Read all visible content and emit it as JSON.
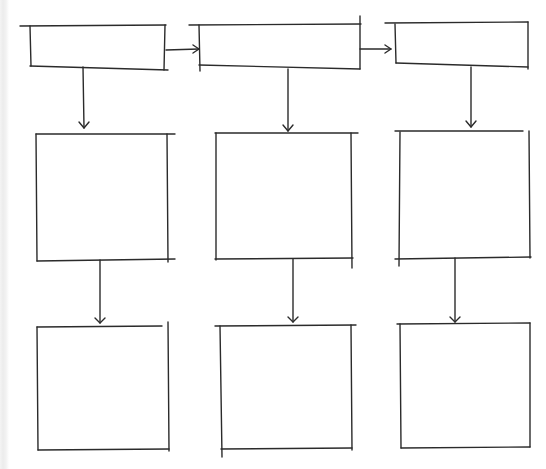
{
  "diagram": {
    "title": "",
    "line_color": "#2b2b2b",
    "background_color": "#ffffff",
    "nodes": [
      {
        "id": "top-1",
        "row": 0,
        "col": 0,
        "label": "",
        "shape": "wide-rectangle"
      },
      {
        "id": "top-2",
        "row": 0,
        "col": 1,
        "label": "",
        "shape": "wide-rectangle"
      },
      {
        "id": "top-3",
        "row": 0,
        "col": 2,
        "label": "",
        "shape": "wide-rectangle"
      },
      {
        "id": "mid-1",
        "row": 1,
        "col": 0,
        "label": "",
        "shape": "square"
      },
      {
        "id": "mid-2",
        "row": 1,
        "col": 1,
        "label": "",
        "shape": "square"
      },
      {
        "id": "mid-3",
        "row": 1,
        "col": 2,
        "label": "",
        "shape": "square"
      },
      {
        "id": "bot-1",
        "row": 2,
        "col": 0,
        "label": "",
        "shape": "square"
      },
      {
        "id": "bot-2",
        "row": 2,
        "col": 1,
        "label": "",
        "shape": "square"
      },
      {
        "id": "bot-3",
        "row": 2,
        "col": 2,
        "label": "",
        "shape": "square"
      }
    ],
    "edges": [
      {
        "from": "top-1",
        "to": "top-2",
        "direction": "right"
      },
      {
        "from": "top-2",
        "to": "top-3",
        "direction": "right"
      },
      {
        "from": "top-1",
        "to": "mid-1",
        "direction": "down"
      },
      {
        "from": "top-2",
        "to": "mid-2",
        "direction": "down"
      },
      {
        "from": "top-3",
        "to": "mid-3",
        "direction": "down"
      },
      {
        "from": "mid-1",
        "to": "bot-1",
        "direction": "down"
      },
      {
        "from": "mid-2",
        "to": "bot-2",
        "direction": "down"
      },
      {
        "from": "mid-3",
        "to": "bot-3",
        "direction": "down"
      }
    ]
  }
}
